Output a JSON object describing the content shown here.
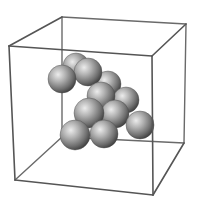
{
  "figure": {
    "kind": "3d-sphere-packing-in-cube",
    "background": "#ffffff",
    "edge_color": "#555555",
    "sphere_colors": {
      "highlight": "#e8e8e8",
      "mid": "#9a9a9a",
      "shadow": "#3c3c3c"
    },
    "cube": {
      "front": {
        "tl": [
          9,
          46
        ],
        "tr": [
          152,
          56
        ],
        "br": [
          153,
          195
        ],
        "bl": [
          15,
          180
        ]
      },
      "back": {
        "tl": [
          62,
          17
        ],
        "tr": [
          186,
          24
        ],
        "br": [
          184,
          143
        ],
        "bl": [
          62,
          137
        ]
      }
    },
    "spheres": [
      {
        "cx": 76,
        "cy": 66,
        "r": 13
      },
      {
        "cx": 108,
        "cy": 84,
        "r": 13
      },
      {
        "cx": 126,
        "cy": 100,
        "r": 13
      },
      {
        "cx": 88,
        "cy": 72,
        "r": 14
      },
      {
        "cx": 62,
        "cy": 79,
        "r": 14
      },
      {
        "cx": 101,
        "cy": 96,
        "r": 14
      },
      {
        "cx": 115,
        "cy": 114,
        "r": 14
      },
      {
        "cx": 89,
        "cy": 113,
        "r": 15
      },
      {
        "cx": 140,
        "cy": 125,
        "r": 14
      },
      {
        "cx": 104,
        "cy": 134,
        "r": 14
      },
      {
        "cx": 75,
        "cy": 135,
        "r": 15
      }
    ],
    "sphere_count": 11
  }
}
